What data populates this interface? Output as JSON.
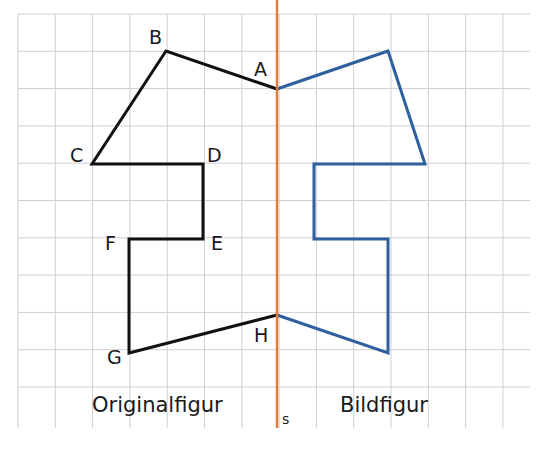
{
  "diagram": {
    "type": "axial-reflection",
    "grid": {
      "x0": 18,
      "y0": 14,
      "cell": 37.3,
      "cols": 14,
      "rows": 11.5,
      "color": "#cfcfcf"
    },
    "axis": {
      "label": "s",
      "x": 277,
      "color": "#e07b39"
    },
    "original": {
      "caption": "Originalfigur",
      "color": "#111111",
      "points": [
        {
          "name": "A",
          "x": 277,
          "y": 89
        },
        {
          "name": "B",
          "x": 166,
          "y": 51
        },
        {
          "name": "C",
          "x": 92,
          "y": 164
        },
        {
          "name": "D",
          "x": 203,
          "y": 164
        },
        {
          "name": "E",
          "x": 203,
          "y": 239
        },
        {
          "name": "F",
          "x": 129,
          "y": 239
        },
        {
          "name": "G",
          "x": 129,
          "y": 353
        },
        {
          "name": "H",
          "x": 277,
          "y": 315
        }
      ]
    },
    "image": {
      "caption": "Bildfigur",
      "color": "#2f5f9e",
      "points": [
        {
          "name": "A'",
          "x": 277,
          "y": 89
        },
        {
          "name": "B'",
          "x": 388,
          "y": 51
        },
        {
          "name": "C'",
          "x": 425,
          "y": 164
        },
        {
          "name": "D'",
          "x": 314,
          "y": 164
        },
        {
          "name": "E'",
          "x": 314,
          "y": 239
        },
        {
          "name": "F'",
          "x": 388,
          "y": 239
        },
        {
          "name": "G'",
          "x": 388,
          "y": 353
        },
        {
          "name": "H'",
          "x": 277,
          "y": 315
        }
      ]
    },
    "labels": [
      {
        "text": "B",
        "x": 149,
        "y": 44
      },
      {
        "text": "A",
        "x": 254,
        "y": 76
      },
      {
        "text": "C",
        "x": 70,
        "y": 162
      },
      {
        "text": "D",
        "x": 207,
        "y": 162
      },
      {
        "text": "F",
        "x": 105,
        "y": 250
      },
      {
        "text": "E",
        "x": 211,
        "y": 250
      },
      {
        "text": "G",
        "x": 107,
        "y": 364
      },
      {
        "text": "H",
        "x": 254,
        "y": 342
      }
    ]
  }
}
